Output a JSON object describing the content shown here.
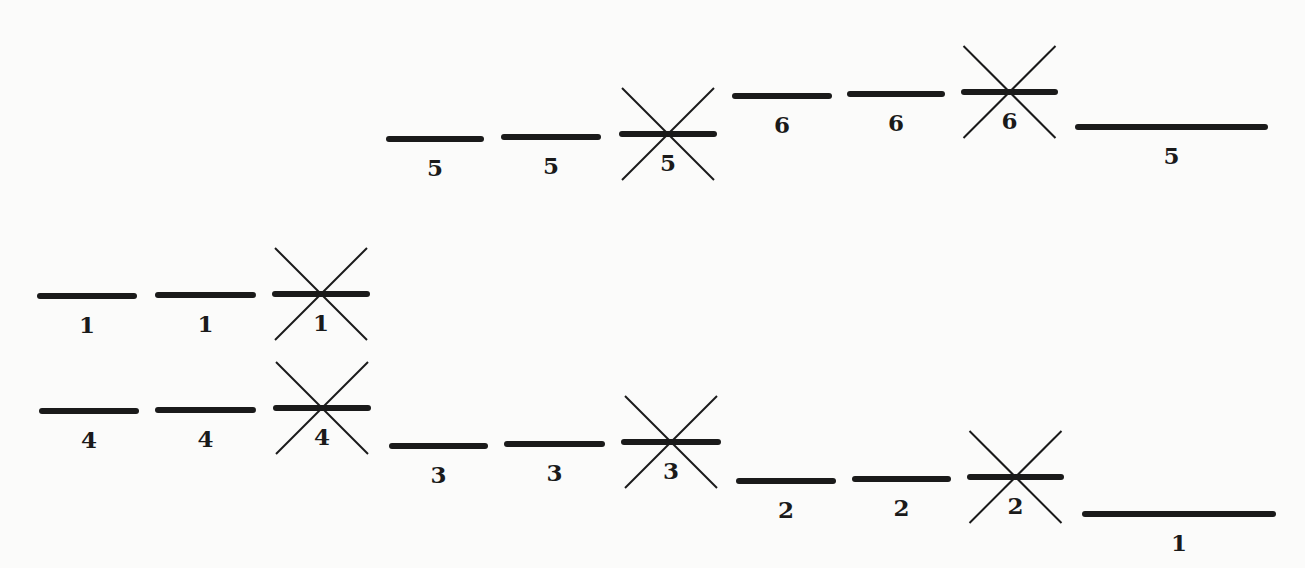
{
  "diagram": {
    "type": "energy-level-diagram",
    "colors": {
      "bar": "#1a1a1a",
      "cross": "#1a1a1a",
      "label": "#1a1a1a",
      "background": "#fbfbfa"
    },
    "levels": [
      {
        "label": "1",
        "x1": 40,
        "x2": 134,
        "y": 296,
        "crossed": false
      },
      {
        "label": "1",
        "x1": 158,
        "x2": 253,
        "y": 295,
        "crossed": false
      },
      {
        "label": "1",
        "x1": 275,
        "x2": 367,
        "y": 294,
        "crossed": true
      },
      {
        "label": "4",
        "x1": 42,
        "x2": 136,
        "y": 411,
        "crossed": false
      },
      {
        "label": "4",
        "x1": 158,
        "x2": 253,
        "y": 410,
        "crossed": false
      },
      {
        "label": "4",
        "x1": 276,
        "x2": 368,
        "y": 408,
        "crossed": true
      },
      {
        "label": "5",
        "x1": 389,
        "x2": 481,
        "y": 139,
        "crossed": false
      },
      {
        "label": "5",
        "x1": 504,
        "x2": 598,
        "y": 137,
        "crossed": false
      },
      {
        "label": "5",
        "x1": 622,
        "x2": 714,
        "y": 134,
        "crossed": true
      },
      {
        "label": "6",
        "x1": 735,
        "x2": 829,
        "y": 96,
        "crossed": false
      },
      {
        "label": "6",
        "x1": 850,
        "x2": 942,
        "y": 94,
        "crossed": false
      },
      {
        "label": "6",
        "x1": 964,
        "x2": 1055,
        "y": 92,
        "crossed": true
      },
      {
        "label": "5",
        "x1": 1078,
        "x2": 1265,
        "y": 127,
        "crossed": false
      },
      {
        "label": "3",
        "x1": 392,
        "x2": 485,
        "y": 446,
        "crossed": false
      },
      {
        "label": "3",
        "x1": 507,
        "x2": 602,
        "y": 444,
        "crossed": false
      },
      {
        "label": "3",
        "x1": 624,
        "x2": 718,
        "y": 442,
        "crossed": true
      },
      {
        "label": "2",
        "x1": 739,
        "x2": 833,
        "y": 481,
        "crossed": false
      },
      {
        "label": "2",
        "x1": 855,
        "x2": 948,
        "y": 479,
        "crossed": false
      },
      {
        "label": "2",
        "x1": 970,
        "x2": 1061,
        "y": 477,
        "crossed": true
      },
      {
        "label": "1",
        "x1": 1085,
        "x2": 1273,
        "y": 514,
        "crossed": false
      }
    ]
  }
}
